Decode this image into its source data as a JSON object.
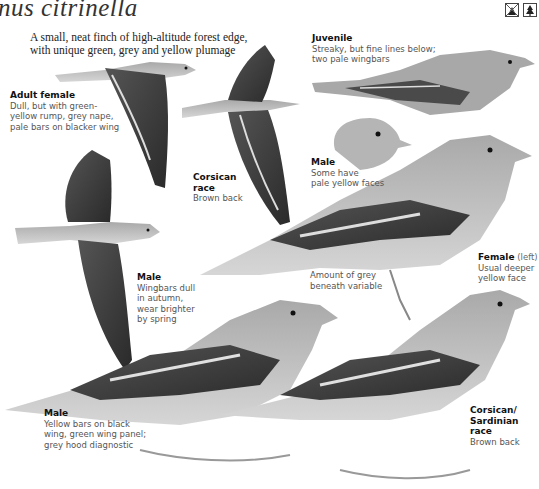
{
  "header": {
    "title": "nus citrinella",
    "intro_lines": [
      "A small, neat finch of high-altitude forest edge,",
      "with unique green, grey and yellow plumage"
    ],
    "habitat_icons": [
      "open-country-crossed-icon",
      "conifer-forest-icon"
    ]
  },
  "labels": {
    "adult_female": {
      "heading": "Adult female",
      "lines": [
        "Dull, but with green-",
        "yellow rump, grey nape,",
        "pale bars on blacker wing"
      ]
    },
    "juvenile": {
      "heading": "Juvenile",
      "lines": [
        "Streaky, but fine lines below;",
        "two pale wingbars"
      ]
    },
    "corsican_race_flight": {
      "heading_lines": [
        "Corsican",
        "race"
      ],
      "lines": [
        "Brown back"
      ]
    },
    "male_face": {
      "heading": "Male",
      "lines": [
        "Some have",
        "pale yellow faces"
      ]
    },
    "grey_beneath": {
      "lines": [
        "Amount of grey",
        "beneath variable"
      ]
    },
    "female_left": {
      "heading": "Female",
      "heading_note": "(left)",
      "lines": [
        "Usual deeper",
        "yellow face"
      ]
    },
    "male_flight": {
      "heading": "Male",
      "lines": [
        "Wingbars dull",
        "in autumn,",
        "wear brighter",
        "by spring"
      ]
    },
    "male_perched": {
      "heading": "Male",
      "lines": [
        "Yellow bars on black",
        "wing, green wing panel;",
        "grey hood diagnostic"
      ]
    },
    "corsican_sardinian": {
      "heading_lines": [
        "Corsican/",
        "Sardinian",
        "race"
      ],
      "lines": [
        "Brown back"
      ]
    }
  },
  "colors": {
    "background": "#ffffff",
    "bird_grey": "#9a9a9a",
    "bird_dark": "#2a2a2a",
    "bird_light": "#cfcfcf",
    "wingbar": "#d8d8d8"
  }
}
